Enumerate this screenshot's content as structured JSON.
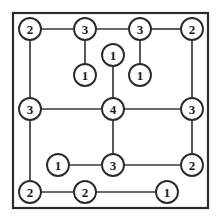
{
  "diagram": {
    "type": "node-degree-graph",
    "canvas": {
      "width": 222,
      "height": 216
    },
    "frame": {
      "x": 13,
      "y": 13,
      "width": 195,
      "height": 195
    },
    "colors": {
      "background": "#ffffff",
      "frame_stroke": "#2b2b2b",
      "edge_stroke": "#3a3a3a",
      "node_fill": "#ffffff",
      "node_stroke": "#2b2b2b",
      "label_color": "#1a1a1a"
    },
    "node_radius": 11,
    "nodes": [
      {
        "id": "n1",
        "label": "2",
        "x": 30,
        "y": 29
      },
      {
        "id": "n2",
        "label": "3",
        "x": 85,
        "y": 29
      },
      {
        "id": "n3",
        "label": "3",
        "x": 140,
        "y": 29
      },
      {
        "id": "n4",
        "label": "2",
        "x": 192,
        "y": 29
      },
      {
        "id": "n5",
        "label": "1",
        "x": 113,
        "y": 55
      },
      {
        "id": "n6",
        "label": "1",
        "x": 85,
        "y": 75
      },
      {
        "id": "n7",
        "label": "1",
        "x": 140,
        "y": 75
      },
      {
        "id": "n8",
        "label": "3",
        "x": 30,
        "y": 109
      },
      {
        "id": "n9",
        "label": "4",
        "x": 113,
        "y": 109
      },
      {
        "id": "n10",
        "label": "3",
        "x": 192,
        "y": 109
      },
      {
        "id": "n11",
        "label": "1",
        "x": 58,
        "y": 165
      },
      {
        "id": "n12",
        "label": "3",
        "x": 113,
        "y": 165
      },
      {
        "id": "n13",
        "label": "2",
        "x": 192,
        "y": 165
      },
      {
        "id": "n14",
        "label": "2",
        "x": 30,
        "y": 192
      },
      {
        "id": "n15",
        "label": "2",
        "x": 85,
        "y": 192
      },
      {
        "id": "n16",
        "label": "1",
        "x": 167,
        "y": 192
      }
    ],
    "edges": [
      {
        "from": "n1",
        "to": "n2"
      },
      {
        "from": "n2",
        "to": "n3"
      },
      {
        "from": "n3",
        "to": "n4"
      },
      {
        "from": "n1",
        "to": "n8"
      },
      {
        "from": "n4",
        "to": "n10"
      },
      {
        "from": "n2",
        "to": "n6"
      },
      {
        "from": "n3",
        "to": "n7"
      },
      {
        "from": "n5",
        "to": "n9"
      },
      {
        "from": "n8",
        "to": "n9"
      },
      {
        "from": "n9",
        "to": "n10"
      },
      {
        "from": "n8",
        "to": "n14"
      },
      {
        "from": "n10",
        "to": "n13"
      },
      {
        "from": "n9",
        "to": "n12"
      },
      {
        "from": "n11",
        "to": "n12"
      },
      {
        "from": "n12",
        "to": "n13"
      },
      {
        "from": "n14",
        "to": "n15"
      },
      {
        "from": "n15",
        "to": "n16"
      }
    ]
  }
}
